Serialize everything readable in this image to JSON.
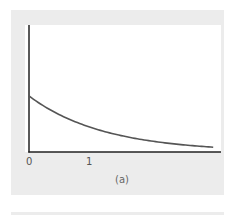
{
  "chart_data": {
    "type": "line",
    "title": "",
    "caption": "(a)",
    "xlabel": "",
    "ylabel": "",
    "x_ticks": [
      "0",
      "1"
    ],
    "xlim": [
      0,
      3.2
    ],
    "grid": false,
    "legend": null,
    "series": [
      {
        "name": "decaying curve",
        "description": "exponential decay from y-intercept approaching zero",
        "x": [
          0,
          0.25,
          0.5,
          0.75,
          1.0,
          1.5,
          2.0,
          2.5,
          3.0,
          3.07
        ],
        "y": [
          1.0,
          0.82,
          0.67,
          0.55,
          0.45,
          0.3,
          0.2,
          0.14,
          0.09,
          0.085
        ],
        "color": "#555555"
      }
    ]
  },
  "colors": {
    "panel": "#ececec",
    "axis": "#222222",
    "curve": "#555555"
  }
}
